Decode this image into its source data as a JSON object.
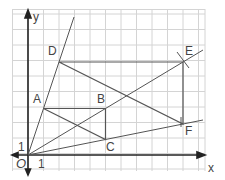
{
  "diagram": {
    "type": "enlargement-coordinate-grid",
    "axes": {
      "x_label": "x",
      "y_label": "y",
      "origin_label": "O",
      "x_unit_label": "1",
      "y_unit_label": "1"
    },
    "grid": {
      "cols": 12.5,
      "rows": 10.5,
      "cell_px": 15.5
    },
    "points": [
      {
        "name": "A",
        "x": 1,
        "y": 3
      },
      {
        "name": "B",
        "x": 5,
        "y": 3
      },
      {
        "name": "C",
        "x": 5,
        "y": 1
      },
      {
        "name": "D",
        "x": 2,
        "y": 6
      },
      {
        "name": "E",
        "x": 10,
        "y": 6
      },
      {
        "name": "F",
        "x": 10,
        "y": 2
      }
    ],
    "triangles": [
      [
        "A",
        "B",
        "C"
      ],
      [
        "D",
        "E",
        "F"
      ]
    ],
    "rays_from_origin_through": [
      "A",
      "B",
      "C"
    ],
    "colors": {
      "grid": "#d0d0d0",
      "lines": "#555555",
      "axes": "#222222"
    }
  }
}
